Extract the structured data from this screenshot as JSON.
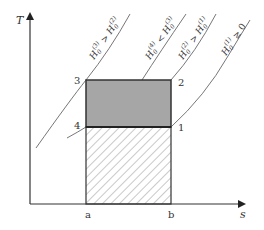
{
  "diagram": {
    "type": "T-s diagram",
    "axes": {
      "y_label": "T",
      "x_label": "s"
    },
    "x_ticks": [
      {
        "label": "a"
      },
      {
        "label": "b"
      }
    ],
    "points": [
      {
        "id": "1",
        "label": "1"
      },
      {
        "id": "2",
        "label": "2"
      },
      {
        "id": "3",
        "label": "3"
      },
      {
        "id": "4",
        "label": "4"
      }
    ],
    "curves": [
      {
        "id": "H3",
        "label_main": "H",
        "sub": "0",
        "sup": "(3)",
        "rel": " > ",
        "main2": "H",
        "sub2": "0",
        "sup2": "(2)"
      },
      {
        "id": "H4",
        "label_main": "H",
        "sub": "0",
        "sup": "(4)",
        "rel": " < ",
        "main2": "H",
        "sub2": "0",
        "sup2": "(3)"
      },
      {
        "id": "H2",
        "label_main": "H",
        "sub": "0",
        "sup": "(2)",
        "rel": " > ",
        "main2": "H",
        "sub2": "0",
        "sup2": "(1)"
      },
      {
        "id": "H1",
        "label_main": "H",
        "sub": "0",
        "sup": "(1)",
        "rel": " ≥ ",
        "main2": "0",
        "sub2": "",
        "sup2": ""
      }
    ],
    "regions": [
      {
        "name": "work-area",
        "fill": "#a6a6a6"
      },
      {
        "name": "heat-rejected-area",
        "fill": "hatched"
      }
    ],
    "colors": {
      "axis": "#333333",
      "curve": "#666666",
      "box_border": "#333333",
      "gray_fill": "#a6a6a6",
      "hatch": "#777777"
    }
  }
}
